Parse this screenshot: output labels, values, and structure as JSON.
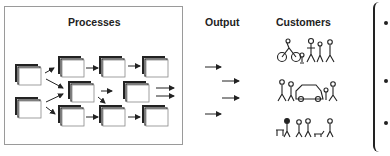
{
  "diagram": {
    "headings": {
      "processes": "Processes",
      "output": "Output",
      "customers": "Customers"
    },
    "process_boxes": [
      {
        "row": "left-top",
        "x": 18,
        "y": 66
      },
      {
        "row": "left-bottom",
        "x": 18,
        "y": 100
      },
      {
        "row": "top",
        "x": 61,
        "y": 59
      },
      {
        "row": "top",
        "x": 101,
        "y": 59
      },
      {
        "row": "top",
        "x": 144,
        "y": 59
      },
      {
        "row": "middle",
        "x": 71,
        "y": 84
      },
      {
        "row": "middle",
        "x": 126,
        "y": 84
      },
      {
        "row": "bottom",
        "x": 61,
        "y": 108
      },
      {
        "row": "bottom",
        "x": 101,
        "y": 108
      },
      {
        "row": "bottom",
        "x": 144,
        "y": 108
      }
    ],
    "output_arrows": 4,
    "customer_groups": [
      {
        "name": "customer-group-1",
        "description": "cyclist and pedestrians"
      },
      {
        "name": "customer-group-2",
        "description": "people around a car"
      },
      {
        "name": "customer-group-3",
        "description": "people walking with dog"
      }
    ],
    "bullets": 3,
    "colors": {
      "line": "#222222",
      "frame": "#9a9a9a",
      "background": "#ffffff"
    }
  }
}
